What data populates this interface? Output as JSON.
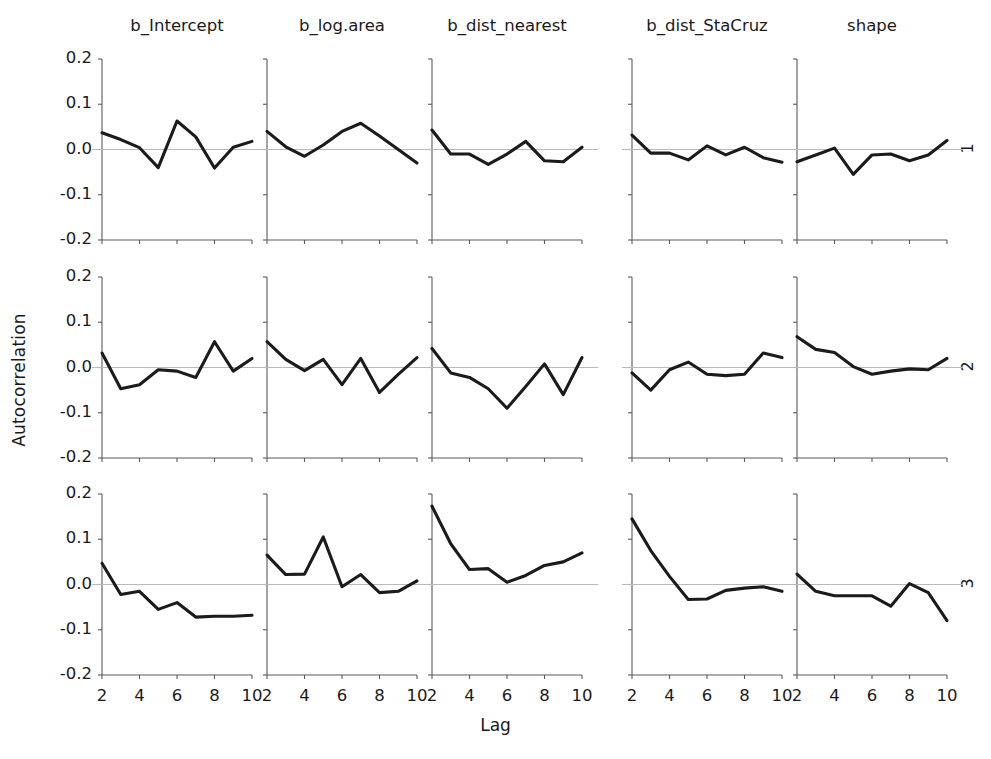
{
  "figure": {
    "ylabel": "Autocorrelation",
    "xlabel": "Lag",
    "column_titles": [
      "b_Intercept",
      "b_log.area",
      "b_dist_nearest",
      "b_dist_StaCruz",
      "shape"
    ],
    "row_labels": [
      "1",
      "2",
      "3"
    ],
    "y_ticks": [
      "0.2",
      "0.1",
      "0.0",
      "-0.1",
      "-0.2"
    ],
    "x_ticks": [
      "2",
      "4",
      "6",
      "8",
      "10"
    ],
    "line_color": "#1b1b1b",
    "axis_color": "#5a5a5a",
    "zero_line_color": "#b9b9b9",
    "background": "#ffffff"
  },
  "chart_data": {
    "type": "line",
    "title": "",
    "xlabel": "Lag",
    "ylabel": "Autocorrelation",
    "xlim": [
      2,
      10
    ],
    "ylim": [
      -0.2,
      0.2
    ],
    "xticks": [
      2,
      4,
      6,
      8,
      10
    ],
    "yticks": [
      -0.2,
      -0.1,
      0.0,
      0.1,
      0.2
    ],
    "grid": false,
    "legend": "none",
    "facet_rows": [
      "1",
      "2",
      "3"
    ],
    "facet_cols": [
      "b_Intercept",
      "b_log.area",
      "b_dist_nearest",
      "b_dist_StaCruz",
      "shape"
    ],
    "x": [
      2,
      3,
      4,
      5,
      6,
      7,
      8,
      9,
      10
    ],
    "panels": [
      {
        "row": "1",
        "col": "b_Intercept",
        "values": [
          0.037,
          0.022,
          0.004,
          -0.04,
          0.063,
          0.028,
          -0.041,
          0.005,
          0.018
        ]
      },
      {
        "row": "1",
        "col": "b_log.area",
        "values": [
          0.04,
          0.006,
          -0.015,
          0.01,
          0.04,
          0.058,
          0.03,
          0.0,
          -0.03
        ]
      },
      {
        "row": "1",
        "col": "b_dist_nearest",
        "values": [
          0.043,
          -0.01,
          -0.01,
          -0.033,
          -0.01,
          0.018,
          -0.025,
          -0.027,
          0.005
        ]
      },
      {
        "row": "1",
        "col": "b_dist_StaCruz",
        "values": [
          0.032,
          -0.008,
          -0.008,
          -0.023,
          0.008,
          -0.012,
          0.005,
          -0.018,
          -0.028
        ]
      },
      {
        "row": "1",
        "col": "shape",
        "values": [
          -0.027,
          -0.012,
          0.003,
          -0.055,
          -0.012,
          -0.01,
          -0.025,
          -0.012,
          0.02
        ]
      },
      {
        "row": "2",
        "col": "b_Intercept",
        "values": [
          0.032,
          -0.047,
          -0.038,
          -0.005,
          -0.008,
          -0.022,
          0.057,
          -0.008,
          0.02
        ]
      },
      {
        "row": "2",
        "col": "b_log.area",
        "values": [
          0.057,
          0.018,
          -0.007,
          0.018,
          -0.038,
          0.02,
          -0.055,
          -0.015,
          0.022
        ]
      },
      {
        "row": "2",
        "col": "b_dist_nearest",
        "values": [
          0.042,
          -0.012,
          -0.022,
          -0.047,
          -0.09,
          -0.042,
          0.008,
          -0.06,
          0.022
        ]
      },
      {
        "row": "2",
        "col": "b_dist_StaCruz",
        "values": [
          -0.012,
          -0.05,
          -0.005,
          0.012,
          -0.015,
          -0.018,
          -0.015,
          0.032,
          0.022
        ]
      },
      {
        "row": "2",
        "col": "shape",
        "values": [
          0.068,
          0.04,
          0.033,
          0.002,
          -0.015,
          -0.008,
          -0.003,
          -0.005,
          0.02
        ]
      },
      {
        "row": "3",
        "col": "b_Intercept",
        "values": [
          0.047,
          -0.022,
          -0.015,
          -0.055,
          -0.04,
          -0.072,
          -0.07,
          -0.07,
          -0.068
        ]
      },
      {
        "row": "3",
        "col": "b_log.area",
        "values": [
          0.065,
          0.022,
          0.023,
          0.105,
          -0.005,
          0.022,
          -0.018,
          -0.015,
          0.008
        ]
      },
      {
        "row": "3",
        "col": "b_dist_nearest",
        "values": [
          0.173,
          0.09,
          0.033,
          0.035,
          0.005,
          0.02,
          0.042,
          0.05,
          0.07
        ]
      },
      {
        "row": "3",
        "col": "b_dist_StaCruz",
        "values": [
          0.145,
          0.075,
          0.018,
          -0.033,
          -0.032,
          -0.013,
          -0.008,
          -0.005,
          -0.015
        ]
      },
      {
        "row": "3",
        "col": "shape",
        "values": [
          0.023,
          -0.015,
          -0.025,
          -0.025,
          -0.025,
          -0.048,
          0.002,
          -0.018,
          -0.08
        ]
      }
    ]
  }
}
